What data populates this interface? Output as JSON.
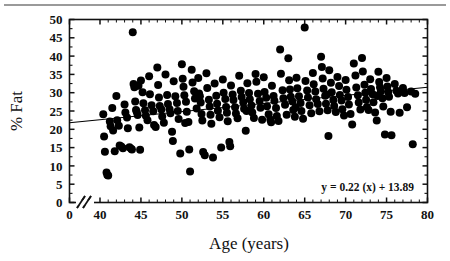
{
  "figure": {
    "top_rule_color": "#9a9a9a",
    "background": "#ffffff"
  },
  "chart_data": {
    "type": "scatter",
    "title": "",
    "xlabel": "Age (years)",
    "ylabel": "% Fat",
    "xlim": [
      0,
      80
    ],
    "ylim": [
      0,
      50
    ],
    "x_axis_break": true,
    "x_break_after": 0,
    "x_break_before": 40,
    "xticks": [
      0,
      40,
      45,
      50,
      55,
      60,
      65,
      70,
      75,
      80
    ],
    "xticklabels": [
      "0",
      "40",
      "45",
      "50",
      "55",
      "60",
      "65",
      "70",
      "75",
      "80"
    ],
    "x_minor_tick_step": 1,
    "yticks": [
      0,
      5,
      10,
      15,
      20,
      25,
      30,
      35,
      40,
      45,
      50
    ],
    "yticklabels": [
      "0",
      "5",
      "10",
      "15",
      "20",
      "25",
      "30",
      "35",
      "40",
      "45",
      "50"
    ],
    "grid": false,
    "legend": null,
    "frame": "box",
    "tick_direction": "in",
    "marker": "filled-circle",
    "marker_color": "#000000",
    "marker_size_px": 5.6,
    "annotations": [
      {
        "name": "regression-equation",
        "text": "y = 0.22 (x) + 13.89",
        "x": 72.0,
        "y": 4.2,
        "align": "right"
      }
    ],
    "trendline": {
      "name": "least-squares-fit",
      "slope": 0.22,
      "intercept": 13.89,
      "equation": "y = 0.22 (x) + 13.89",
      "color": "#000000",
      "width_px": 1.1,
      "x_start": 36.0,
      "x_end": 80.0,
      "y_start": 21.81,
      "y_end": 31.49
    },
    "n_points": 240,
    "points": [
      [
        40.4,
        24.1
      ],
      [
        40.5,
        18.0
      ],
      [
        40.6,
        13.9
      ],
      [
        40.8,
        8.2
      ],
      [
        40.9,
        7.5
      ],
      [
        41.0,
        7.4
      ],
      [
        41.2,
        22.1
      ],
      [
        41.3,
        20.8
      ],
      [
        41.5,
        25.8
      ],
      [
        41.6,
        19.7
      ],
      [
        41.8,
        14.0
      ],
      [
        42.0,
        29.1
      ],
      [
        42.1,
        22.5
      ],
      [
        42.3,
        21.0
      ],
      [
        42.4,
        15.6
      ],
      [
        42.6,
        15.3
      ],
      [
        42.8,
        14.8
      ],
      [
        43.0,
        26.8
      ],
      [
        43.1,
        24.6
      ],
      [
        43.3,
        23.2
      ],
      [
        43.4,
        20.3
      ],
      [
        43.6,
        15.1
      ],
      [
        43.8,
        14.7
      ],
      [
        43.9,
        14.5
      ],
      [
        44.0,
        46.5
      ],
      [
        44.1,
        32.4
      ],
      [
        44.2,
        31.5
      ],
      [
        44.3,
        27.6
      ],
      [
        44.4,
        25.3
      ],
      [
        44.5,
        24.7
      ],
      [
        44.6,
        23.9
      ],
      [
        44.8,
        20.5
      ],
      [
        44.9,
        14.4
      ],
      [
        45.0,
        33.3
      ],
      [
        45.2,
        30.1
      ],
      [
        45.3,
        27.1
      ],
      [
        45.5,
        25.2
      ],
      [
        45.6,
        23.7
      ],
      [
        45.8,
        22.5
      ],
      [
        46.0,
        34.5
      ],
      [
        46.1,
        29.6
      ],
      [
        46.3,
        26.6
      ],
      [
        46.5,
        24.9
      ],
      [
        46.6,
        21.2
      ],
      [
        46.8,
        20.6
      ],
      [
        47.0,
        36.9
      ],
      [
        47.1,
        32.1
      ],
      [
        47.2,
        28.7
      ],
      [
        47.3,
        26.4
      ],
      [
        47.5,
        25.4
      ],
      [
        47.6,
        23.5
      ],
      [
        47.8,
        21.8
      ],
      [
        48.0,
        35.0
      ],
      [
        48.2,
        29.4
      ],
      [
        48.3,
        26.9
      ],
      [
        48.5,
        25.5
      ],
      [
        48.6,
        24.4
      ],
      [
        48.8,
        19.3
      ],
      [
        48.9,
        16.8
      ],
      [
        49.0,
        33.1
      ],
      [
        49.2,
        29.0
      ],
      [
        49.4,
        27.2
      ],
      [
        49.5,
        25.0
      ],
      [
        49.6,
        22.8
      ],
      [
        49.8,
        13.4
      ],
      [
        50.0,
        37.8
      ],
      [
        50.1,
        33.8
      ],
      [
        50.2,
        31.6
      ],
      [
        50.3,
        29.3
      ],
      [
        50.5,
        27.5
      ],
      [
        50.6,
        24.8
      ],
      [
        50.8,
        22.0
      ],
      [
        50.9,
        14.5
      ],
      [
        51.0,
        8.5
      ],
      [
        51.2,
        36.3
      ],
      [
        51.3,
        32.8
      ],
      [
        51.5,
        30.4
      ],
      [
        51.6,
        28.4
      ],
      [
        51.8,
        25.7
      ],
      [
        52.0,
        34.0
      ],
      [
        52.1,
        29.8
      ],
      [
        52.3,
        27.3
      ],
      [
        52.4,
        24.2
      ],
      [
        52.5,
        22.4
      ],
      [
        52.6,
        13.8
      ],
      [
        52.8,
        12.9
      ],
      [
        53.0,
        35.3
      ],
      [
        53.1,
        31.3
      ],
      [
        53.3,
        28.1
      ],
      [
        53.4,
        26.2
      ],
      [
        53.5,
        24.0
      ],
      [
        53.6,
        21.5
      ],
      [
        53.8,
        12.3
      ],
      [
        54.0,
        32.5
      ],
      [
        54.2,
        29.2
      ],
      [
        54.3,
        27.0
      ],
      [
        54.4,
        25.1
      ],
      [
        54.6,
        23.3
      ],
      [
        54.8,
        15.0
      ],
      [
        55.0,
        33.6
      ],
      [
        55.1,
        30.0
      ],
      [
        55.3,
        28.3
      ],
      [
        55.4,
        26.1
      ],
      [
        55.5,
        24.5
      ],
      [
        55.6,
        22.2
      ],
      [
        55.8,
        16.5
      ],
      [
        55.9,
        15.4
      ],
      [
        56.0,
        32.0
      ],
      [
        56.2,
        29.5
      ],
      [
        56.3,
        28.0
      ],
      [
        56.5,
        26.0
      ],
      [
        56.6,
        24.3
      ],
      [
        56.8,
        23.0
      ],
      [
        57.0,
        34.6
      ],
      [
        57.2,
        30.5
      ],
      [
        57.3,
        28.8
      ],
      [
        57.5,
        27.4
      ],
      [
        57.6,
        25.6
      ],
      [
        57.8,
        19.6
      ],
      [
        58.0,
        32.6
      ],
      [
        58.2,
        29.9
      ],
      [
        58.3,
        28.2
      ],
      [
        58.5,
        26.5
      ],
      [
        58.6,
        24.6
      ],
      [
        58.8,
        23.1
      ],
      [
        59.0,
        35.1
      ],
      [
        59.1,
        33.0
      ],
      [
        59.3,
        29.7
      ],
      [
        59.5,
        27.7
      ],
      [
        59.6,
        25.9
      ],
      [
        59.8,
        22.6
      ],
      [
        60.0,
        34.2
      ],
      [
        60.1,
        30.2
      ],
      [
        60.3,
        28.6
      ],
      [
        60.4,
        26.3
      ],
      [
        60.6,
        24.1
      ],
      [
        60.8,
        22.7
      ],
      [
        60.9,
        21.9
      ],
      [
        61.0,
        31.9
      ],
      [
        61.2,
        29.1
      ],
      [
        61.3,
        27.8
      ],
      [
        61.5,
        25.8
      ],
      [
        61.6,
        23.6
      ],
      [
        61.8,
        22.3
      ],
      [
        62.0,
        41.8
      ],
      [
        62.1,
        35.2
      ],
      [
        62.3,
        30.7
      ],
      [
        62.4,
        28.5
      ],
      [
        62.6,
        26.7
      ],
      [
        62.8,
        24.0
      ],
      [
        63.0,
        39.4
      ],
      [
        63.1,
        33.4
      ],
      [
        63.2,
        30.9
      ],
      [
        63.3,
        28.9
      ],
      [
        63.5,
        27.6
      ],
      [
        63.6,
        25.3
      ],
      [
        63.8,
        23.4
      ],
      [
        64.0,
        34.1
      ],
      [
        64.1,
        31.2
      ],
      [
        64.3,
        29.0
      ],
      [
        64.5,
        27.2
      ],
      [
        64.6,
        25.0
      ],
      [
        64.8,
        22.9
      ],
      [
        65.0,
        47.8
      ],
      [
        65.1,
        33.2
      ],
      [
        65.3,
        30.6
      ],
      [
        65.4,
        28.7
      ],
      [
        65.6,
        26.6
      ],
      [
        65.8,
        24.4
      ],
      [
        66.0,
        35.4
      ],
      [
        66.1,
        32.3
      ],
      [
        66.3,
        30.3
      ],
      [
        66.4,
        28.2
      ],
      [
        66.6,
        26.9
      ],
      [
        66.8,
        24.9
      ],
      [
        67.0,
        39.8
      ],
      [
        67.1,
        37.0
      ],
      [
        67.2,
        33.9
      ],
      [
        67.3,
        31.1
      ],
      [
        67.5,
        29.2
      ],
      [
        67.6,
        27.0
      ],
      [
        67.8,
        25.2
      ],
      [
        67.9,
        18.2
      ],
      [
        68.0,
        36.1
      ],
      [
        68.2,
        32.7
      ],
      [
        68.3,
        30.1
      ],
      [
        68.5,
        28.0
      ],
      [
        68.6,
        26.4
      ],
      [
        68.8,
        24.7
      ],
      [
        69.0,
        34.3
      ],
      [
        69.2,
        31.8
      ],
      [
        69.3,
        29.4
      ],
      [
        69.5,
        27.9
      ],
      [
        69.6,
        25.5
      ],
      [
        69.8,
        23.8
      ],
      [
        70.0,
        33.5
      ],
      [
        70.1,
        30.8
      ],
      [
        70.3,
        28.8
      ],
      [
        70.4,
        26.8
      ],
      [
        70.6,
        24.2
      ],
      [
        70.8,
        21.3
      ],
      [
        71.0,
        38.0
      ],
      [
        71.2,
        34.7
      ],
      [
        71.3,
        31.4
      ],
      [
        71.5,
        29.3
      ],
      [
        71.6,
        27.3
      ],
      [
        71.8,
        25.4
      ],
      [
        72.0,
        39.5
      ],
      [
        72.1,
        35.8
      ],
      [
        72.3,
        32.2
      ],
      [
        72.4,
        30.0
      ],
      [
        72.5,
        28.1
      ],
      [
        72.6,
        26.1
      ],
      [
        72.8,
        25.3
      ],
      [
        73.0,
        33.7
      ],
      [
        73.1,
        31.0
      ],
      [
        73.3,
        29.6
      ],
      [
        73.4,
        27.4
      ],
      [
        73.6,
        24.6
      ],
      [
        73.8,
        22.4
      ],
      [
        74.0,
        35.7
      ],
      [
        74.1,
        32.9
      ],
      [
        74.2,
        31.5
      ],
      [
        74.3,
        30.4
      ],
      [
        74.5,
        28.5
      ],
      [
        74.6,
        26.2
      ],
      [
        74.8,
        18.6
      ],
      [
        75.0,
        34.0
      ],
      [
        75.1,
        31.7
      ],
      [
        75.2,
        30.2
      ],
      [
        75.3,
        28.9
      ],
      [
        75.5,
        24.8
      ],
      [
        75.6,
        18.4
      ],
      [
        76.0,
        32.4
      ],
      [
        76.2,
        30.5
      ],
      [
        76.4,
        29.8
      ],
      [
        76.6,
        24.5
      ],
      [
        77.0,
        31.3
      ],
      [
        77.2,
        29.9
      ],
      [
        77.5,
        26.0
      ],
      [
        78.0,
        30.3
      ],
      [
        78.2,
        15.9
      ],
      [
        78.5,
        29.7
      ],
      [
        44.7,
        31.9
      ],
      [
        52.2,
        29.0
      ],
      [
        63.9,
        26.0
      ],
      [
        50.4,
        21.7
      ],
      [
        57.9,
        25.0
      ],
      [
        67.7,
        29.5
      ],
      [
        73.9,
        29.1
      ]
    ]
  },
  "axis_labels": {
    "x_title": "Age (years)",
    "y_title": "% Fat"
  },
  "equation": {
    "text": "y = 0.22 (x) + 13.89"
  }
}
